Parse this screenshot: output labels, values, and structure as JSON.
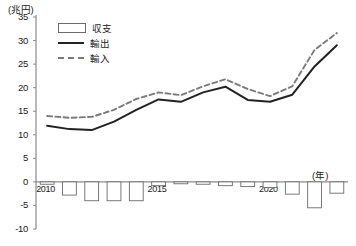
{
  "chart_data": {
    "type": "line",
    "title": "",
    "subtitle": "",
    "unit_label": "(兆円)",
    "xlabel": "(年)",
    "ylabel": "",
    "ylim": [
      -10,
      35
    ],
    "yticks": [
      35,
      30,
      25,
      20,
      15,
      10,
      5,
      0,
      -5,
      -10
    ],
    "grid": false,
    "legend_position": "top-left",
    "x": [
      2010,
      2011,
      2012,
      2013,
      2014,
      2015,
      2016,
      2017,
      2018,
      2019,
      2020,
      2021,
      2022,
      2023
    ],
    "xtick_labels": [
      "2010",
      "2015",
      "2020"
    ],
    "series": [
      {
        "name": "収支",
        "type": "bar",
        "values": [
          -0.5,
          -2.8,
          -4.0,
          -4.0,
          -4.0,
          -0.8,
          -0.4,
          -0.5,
          -0.8,
          -1.0,
          -1.2,
          -2.6,
          -5.5,
          -2.4
        ]
      },
      {
        "name": "輸出",
        "type": "line",
        "style": "solid",
        "values": [
          11.9,
          11.2,
          11.0,
          12.8,
          15.3,
          17.5,
          17.0,
          19.0,
          20.2,
          17.4,
          17.0,
          18.5,
          24.5,
          29.0
        ]
      },
      {
        "name": "輸入",
        "type": "line",
        "style": "dashed",
        "values": [
          14.0,
          13.6,
          13.8,
          15.3,
          17.6,
          19.0,
          18.4,
          20.3,
          21.8,
          19.7,
          18.2,
          20.3,
          28.0,
          31.6
        ]
      }
    ]
  },
  "legend": {
    "items": [
      {
        "label": "収支",
        "key": "box"
      },
      {
        "label": "輸出",
        "key": "solid"
      },
      {
        "label": "輸入",
        "key": "dashed"
      }
    ]
  },
  "axis": {
    "unit_y": "(兆円)",
    "unit_x": "(年)"
  },
  "colors": {
    "export_line": "#222222",
    "import_line": "#7a7a7a",
    "bar_stroke": "#6b6b6b",
    "bar_fill": "#ffffff",
    "axis": "#8a8a8a",
    "text": "#1a1a1a"
  }
}
